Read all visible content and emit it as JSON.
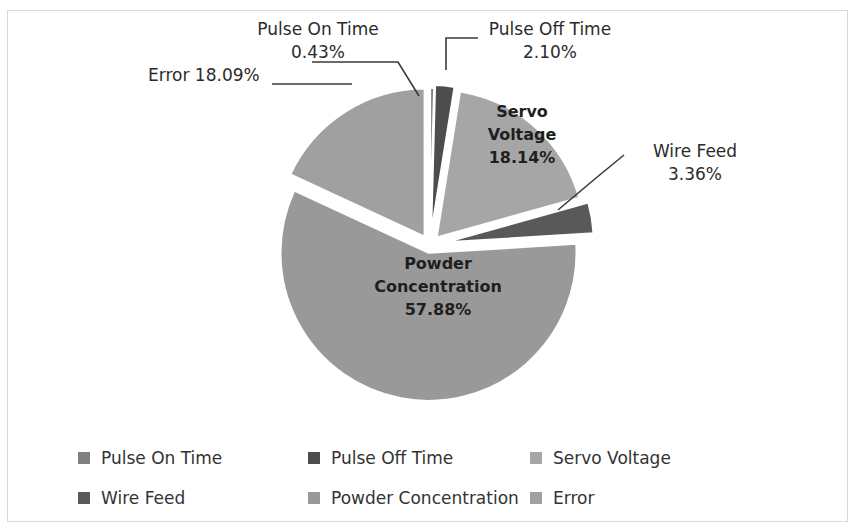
{
  "chart_data": {
    "type": "pie",
    "title": "",
    "categories": [
      "Pulse On Time",
      "Pulse Off Time",
      "Servo Voltage",
      "Wire Feed",
      "Powder Concentration",
      "Error"
    ],
    "values": [
      0.43,
      2.1,
      18.14,
      3.36,
      57.88,
      18.09
    ],
    "value_labels": [
      "0.43%",
      "2.10%",
      "18.14%",
      "3.36%",
      "57.88%",
      "18.09%"
    ],
    "unit": "%",
    "legend_position": "bottom",
    "grid": false,
    "exploded": true,
    "colors": [
      "#808080",
      "#4d4d4d",
      "#a6a6a6",
      "#595959",
      "#999999",
      "#a0a0a0"
    ]
  },
  "callouts": [
    {
      "name": "pulse-on-time",
      "line1": "Pulse On Time",
      "line2": "0.43%"
    },
    {
      "name": "pulse-off-time",
      "line1": "Pulse Off Time",
      "line2": "2.10%"
    },
    {
      "name": "error",
      "line1": "Error 18.09%",
      "line2": ""
    },
    {
      "name": "wire-feed",
      "line1": "Wire Feed",
      "line2": "3.36%"
    }
  ],
  "inner_labels": [
    {
      "name": "servo-voltage",
      "line1": "Servo",
      "line2": "Voltage",
      "line3": "18.14%"
    },
    {
      "name": "powder-concentration",
      "line1": "Powder",
      "line2": "Concentration",
      "line3": "57.88%"
    }
  ],
  "legend": {
    "row1": [
      {
        "label": "Pulse On Time",
        "color": "#808080"
      },
      {
        "label": "Pulse Off Time",
        "color": "#4d4d4d"
      },
      {
        "label": "Servo Voltage",
        "color": "#a6a6a6"
      }
    ],
    "row2": [
      {
        "label": "Wire Feed",
        "color": "#595959"
      },
      {
        "label": "Powder Concentration",
        "color": "#999999"
      },
      {
        "label": "Error",
        "color": "#a0a0a0"
      }
    ]
  }
}
